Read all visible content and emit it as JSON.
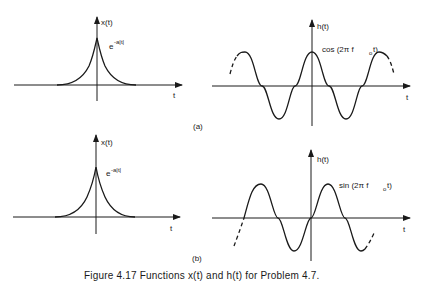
{
  "figure": {
    "caption": "Figure 4.17   Functions x(t) and h(t) for Problem 4.7.",
    "panels": [
      {
        "id": "a",
        "label": "(a)",
        "left": {
          "y_axis_label": "x(t)",
          "x_axis_label": "t",
          "curve_label_base": "e",
          "curve_label_exp": "-a|t|",
          "function": "exp(-a|t|)"
        },
        "right": {
          "y_axis_label": "h(t)",
          "x_axis_label": "t",
          "curve_label_main": "cos (2π f",
          "curve_label_sub": "o",
          "curve_label_tail": " t)",
          "function": "cos(2*pi*f0*t)"
        }
      },
      {
        "id": "b",
        "label": "(b)",
        "left": {
          "y_axis_label": "x(t)",
          "x_axis_label": "t",
          "curve_label_base": "e",
          "curve_label_exp": "-a|t|",
          "function": "exp(-a|t|)"
        },
        "right": {
          "y_axis_label": "h(t)",
          "x_axis_label": "t",
          "curve_label_main": "sin (2π f",
          "curve_label_sub": "o",
          "curve_label_tail": " t)",
          "function": "sin(2*pi*f0*t)"
        }
      }
    ]
  },
  "colors": {
    "ink": "#1a1a1a",
    "background": "#ffffff"
  }
}
